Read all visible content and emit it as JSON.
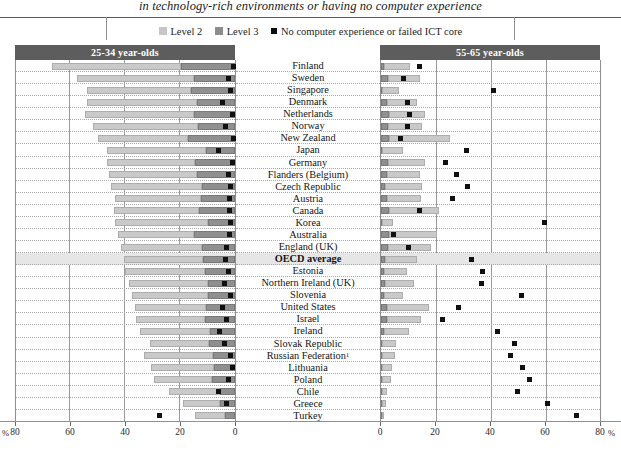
{
  "title": "in technology-rich environments or having no computer experience",
  "legend": {
    "items": [
      {
        "key": "level2",
        "label": "Level 2",
        "icon": "square-swatch-light",
        "color": "#c6c6c6"
      },
      {
        "key": "level3",
        "label": "Level 3",
        "icon": "square-swatch-dark",
        "color": "#8d8d8d"
      },
      {
        "key": "nocomp",
        "label": "No computer experience or failed ICT core",
        "icon": "square-marker-black",
        "color": "#0c0c0c"
      }
    ]
  },
  "panels": {
    "left": {
      "header": "25-34 year-olds"
    },
    "right": {
      "header": "55-65 year-olds"
    }
  },
  "axis": {
    "left": {
      "ticks": [
        "80",
        "60",
        "40",
        "20",
        "0"
      ],
      "unit_prefix": "%"
    },
    "right": {
      "ticks": [
        "0",
        "20",
        "40",
        "60",
        "80"
      ],
      "unit_suffix": "%"
    },
    "max": 80
  },
  "chart_data": {
    "type": "bar",
    "title": "in technology-rich environments or having no computer experience",
    "xlabel": "%",
    "ylabel": "",
    "xlim": [
      0,
      80
    ],
    "grid": true,
    "legend_position": "top-center",
    "orientation": "horizontal",
    "panels": [
      "25-34 year-olds",
      "55-65 year-olds"
    ],
    "series": [
      {
        "name": "Level 2",
        "color": "#c9c9c9"
      },
      {
        "name": "Level 3",
        "color": "#8f8f8f"
      },
      {
        "name": "No computer experience or failed ICT core",
        "color": "#101010",
        "marker": "square"
      }
    ],
    "categories": [
      "Finland",
      "Sweden",
      "Singapore",
      "Denmark",
      "Netherlands",
      "Norway",
      "New Zealand",
      "Japan",
      "Germany",
      "Flanders (Belgium)",
      "Czech Republic",
      "Austria",
      "Canada",
      "Korea",
      "Australia",
      "England (UK)",
      "OECD average",
      "Estonia",
      "Northern Ireland (UK)",
      "Slovenia",
      "United States",
      "Israel",
      "Ireland",
      "Slovak Republic",
      "Russian Federation",
      "Lithuania",
      "Poland",
      "Chile",
      "Greece",
      "Turkey"
    ],
    "highlight_category": "OECD average",
    "footnote_categories": {
      "Russian Federation": "1"
    },
    "rows": [
      {
        "country": "Finland",
        "young": {
          "level2": 47.0,
          "level3": 19.5,
          "nocomp": 0.7
        },
        "old": {
          "level2": 9.5,
          "level3": 1.0,
          "nocomp": 14.0
        }
      },
      {
        "country": "Sweden",
        "young": {
          "level2": 42.5,
          "level3": 15.0,
          "nocomp": 2.5
        },
        "old": {
          "level2": 11.5,
          "level3": 2.5,
          "nocomp": 8.0
        }
      },
      {
        "country": "Singapore",
        "young": {
          "level2": 38.0,
          "level3": 16.0,
          "nocomp": 1.5
        },
        "old": {
          "level2": 6.0,
          "level3": 0.5,
          "nocomp": 41.0
        }
      },
      {
        "country": "Denmark",
        "young": {
          "level2": 40.0,
          "level3": 14.0,
          "nocomp": 4.5
        },
        "old": {
          "level2": 11.0,
          "level3": 2.0,
          "nocomp": 9.5
        }
      },
      {
        "country": "Netherlands",
        "young": {
          "level2": 39.5,
          "level3": 15.0,
          "nocomp": 1.0
        },
        "old": {
          "level2": 13.0,
          "level3": 3.0,
          "nocomp": 10.5
        }
      },
      {
        "country": "Norway",
        "young": {
          "level2": 38.0,
          "level3": 13.5,
          "nocomp": 3.5
        },
        "old": {
          "level2": 12.5,
          "level3": 2.5,
          "nocomp": 9.5
        }
      },
      {
        "country": "New Zealand",
        "young": {
          "level2": 33.0,
          "level3": 17.0,
          "nocomp": 0.5
        },
        "old": {
          "level2": 22.0,
          "level3": 3.0,
          "nocomp": 7.0
        }
      },
      {
        "country": "Japan",
        "young": {
          "level2": 36.0,
          "level3": 10.5,
          "nocomp": 6.0
        },
        "old": {
          "level2": 7.5,
          "level3": 0.5,
          "nocomp": 31.0
        }
      },
      {
        "country": "Germany",
        "young": {
          "level2": 32.0,
          "level3": 14.5,
          "nocomp": 1.0
        },
        "old": {
          "level2": 13.5,
          "level3": 2.5,
          "nocomp": 23.5
        }
      },
      {
        "country": "Flanders (Belgium)",
        "young": {
          "level2": 32.0,
          "level3": 14.0,
          "nocomp": 2.5
        },
        "old": {
          "level2": 12.0,
          "level3": 2.0,
          "nocomp": 27.5
        }
      },
      {
        "country": "Czech Republic",
        "young": {
          "level2": 33.0,
          "level3": 12.0,
          "nocomp": 1.5
        },
        "old": {
          "level2": 13.5,
          "level3": 1.5,
          "nocomp": 31.5
        }
      },
      {
        "country": "Austria",
        "young": {
          "level2": 31.0,
          "level3": 12.5,
          "nocomp": 2.0
        },
        "old": {
          "level2": 12.5,
          "level3": 2.0,
          "nocomp": 26.0
        }
      },
      {
        "country": "Canada",
        "young": {
          "level2": 31.0,
          "level3": 13.0,
          "nocomp": 2.0
        },
        "old": {
          "level2": 18.0,
          "level3": 3.0,
          "nocomp": 14.0
        }
      },
      {
        "country": "Korea",
        "young": {
          "level2": 33.5,
          "level3": 10.0,
          "nocomp": 1.5
        },
        "old": {
          "level2": 4.0,
          "level3": 0.5,
          "nocomp": 59.5
        }
      },
      {
        "country": "Australia",
        "young": {
          "level2": 27.5,
          "level3": 15.0,
          "nocomp": 2.0
        },
        "old": {
          "level2": 17.5,
          "level3": 3.0,
          "nocomp": 4.5
        }
      },
      {
        "country": "England (UK)",
        "young": {
          "level2": 29.5,
          "level3": 12.0,
          "nocomp": 3.0
        },
        "old": {
          "level2": 15.5,
          "level3": 2.5,
          "nocomp": 10.0
        }
      },
      {
        "country": "OECD average",
        "young": {
          "level2": 29.0,
          "level3": 11.5,
          "nocomp": 3.5
        },
        "old": {
          "level2": 11.5,
          "level3": 1.5,
          "nocomp": 33.0
        }
      },
      {
        "country": "Estonia",
        "young": {
          "level2": 29.0,
          "level3": 11.0,
          "nocomp": 2.5
        },
        "old": {
          "level2": 8.5,
          "level3": 1.0,
          "nocomp": 37.0
        }
      },
      {
        "country": "Northern Ireland (UK)",
        "young": {
          "level2": 28.5,
          "level3": 10.0,
          "nocomp": 4.0
        },
        "old": {
          "level2": 10.5,
          "level3": 1.5,
          "nocomp": 36.5
        }
      },
      {
        "country": "Slovenia",
        "young": {
          "level2": 27.5,
          "level3": 10.0,
          "nocomp": 1.5
        },
        "old": {
          "level2": 7.0,
          "level3": 1.0,
          "nocomp": 51.0
        }
      },
      {
        "country": "United States",
        "young": {
          "level2": 26.0,
          "level3": 10.5,
          "nocomp": 4.5
        },
        "old": {
          "level2": 15.5,
          "level3": 2.0,
          "nocomp": 28.0
        }
      },
      {
        "country": "Israel",
        "young": {
          "level2": 25.0,
          "level3": 11.0,
          "nocomp": 3.0
        },
        "old": {
          "level2": 12.5,
          "level3": 2.0,
          "nocomp": 22.5
        }
      },
      {
        "country": "Ireland",
        "young": {
          "level2": 25.5,
          "level3": 9.0,
          "nocomp": 5.5
        },
        "old": {
          "level2": 9.0,
          "level3": 1.0,
          "nocomp": 42.5
        }
      },
      {
        "country": "Slovak Republic",
        "young": {
          "level2": 21.5,
          "level3": 9.5,
          "nocomp": 4.0
        },
        "old": {
          "level2": 5.0,
          "level3": 0.5,
          "nocomp": 48.5
        }
      },
      {
        "country": "Russian Federation",
        "young": {
          "level2": 25.0,
          "level3": 8.0,
          "nocomp": 1.5
        },
        "old": {
          "level2": 4.5,
          "level3": 0.5,
          "nocomp": 47.0
        }
      },
      {
        "country": "Lithuania",
        "young": {
          "level2": 23.0,
          "level3": 7.5,
          "nocomp": 1.0
        },
        "old": {
          "level2": 3.5,
          "level3": 0.5,
          "nocomp": 51.5
        }
      },
      {
        "country": "Poland",
        "young": {
          "level2": 21.0,
          "level3": 8.5,
          "nocomp": 2.5
        },
        "old": {
          "level2": 3.0,
          "level3": 0.5,
          "nocomp": 54.0
        }
      },
      {
        "country": "Chile",
        "young": {
          "level2": 18.5,
          "level3": 5.5,
          "nocomp": 6.0
        },
        "old": {
          "level2": 2.0,
          "level3": 0.3,
          "nocomp": 49.5
        }
      },
      {
        "country": "Greece",
        "young": {
          "level2": 13.5,
          "level3": 5.5,
          "nocomp": 3.0
        },
        "old": {
          "level2": 1.5,
          "level3": 0.3,
          "nocomp": 60.5
        }
      },
      {
        "country": "Turkey",
        "young": {
          "level2": 11.0,
          "level3": 3.5,
          "nocomp": 27.5
        },
        "old": {
          "level2": 0.8,
          "level3": 0.2,
          "nocomp": 71.0
        }
      }
    ]
  }
}
